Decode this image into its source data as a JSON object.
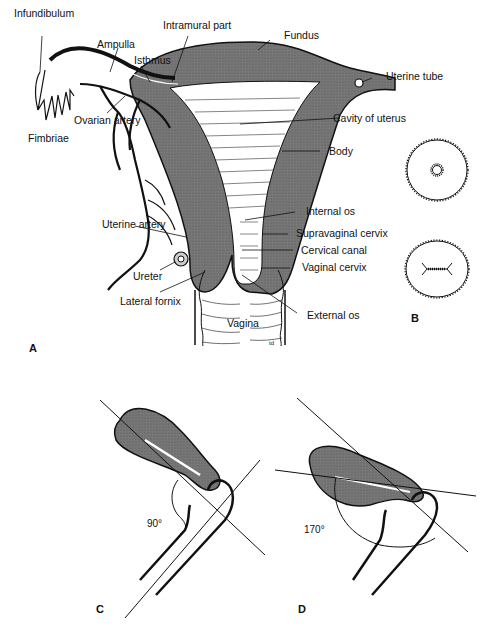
{
  "figure": {
    "panels": {
      "A": "A",
      "B": "B",
      "C": "C",
      "D": "D"
    },
    "panel_a_labels": {
      "infundibulum": "Infundibulum",
      "ampulla": "Ampulla",
      "isthmus": "Isthmus",
      "intramural_part": "Intramural part",
      "fundus": "Fundus",
      "uterine_tube": "Uterine tube",
      "ovarian_artery": "Ovarian artery",
      "fimbriae": "Fimbriae",
      "cavity_of_uterus": "Cavity of uterus",
      "body": "Body",
      "internal_os": "Internal os",
      "uterine_artery": "Uterine artery",
      "supravaginal_cervix": "Supravaginal cervix",
      "cervical_canal": "Cervical canal",
      "ureter": "Ureter",
      "vaginal_cervix": "Vaginal cervix",
      "lateral_fornix": "Lateral fornix",
      "external_os": "External os",
      "vagina": "Vagina",
      "artist_mark": "td"
    },
    "panel_c_labels": {
      "angle": "90°"
    },
    "panel_d_labels": {
      "angle": "170°"
    },
    "colors": {
      "tissue": "#6f6f6f",
      "line": "#111111",
      "background": "#ffffff"
    }
  }
}
